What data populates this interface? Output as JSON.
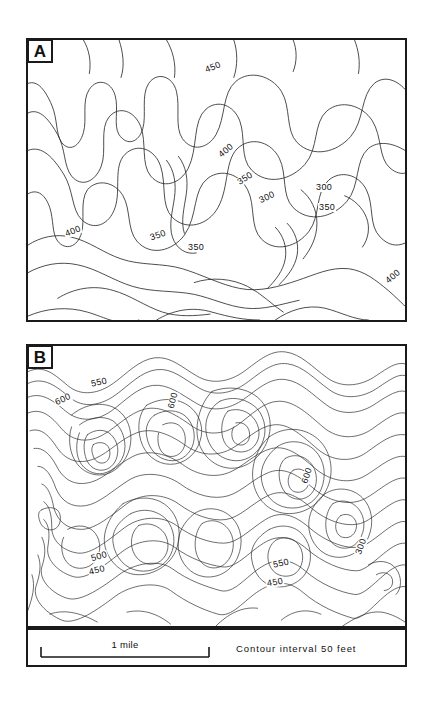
{
  "figure": {
    "background_color": "#ffffff",
    "line_color": "#2b2b2b",
    "border_color": "#1a1a1a"
  },
  "panels": [
    {
      "tag": "A",
      "description": "Topographic contour map with widely spaced, gently curving contours",
      "contour_interval": 50,
      "labels": [
        {
          "text": "450",
          "x": 204,
          "y": 63,
          "rotation": -22
        },
        {
          "text": "400",
          "x": 217,
          "y": 146,
          "rotation": -40
        },
        {
          "text": "350",
          "x": 236,
          "y": 174,
          "rotation": -33
        },
        {
          "text": "300",
          "x": 258,
          "y": 193,
          "rotation": -25
        },
        {
          "text": "300",
          "x": 315,
          "y": 183,
          "rotation": 0
        },
        {
          "text": "350",
          "x": 318,
          "y": 203,
          "rotation": 0
        },
        {
          "text": "400",
          "x": 64,
          "y": 227,
          "rotation": -22
        },
        {
          "text": "350",
          "x": 149,
          "y": 231,
          "rotation": -20
        },
        {
          "text": "350",
          "x": 187,
          "y": 243,
          "rotation": 0
        },
        {
          "text": "400",
          "x": 384,
          "y": 272,
          "rotation": -40
        }
      ]
    },
    {
      "tag": "B",
      "description": "Topographic contour map with densely packed, highly sinuous contours",
      "contour_interval": 50,
      "labels": [
        {
          "text": "550",
          "x": 90,
          "y": 378,
          "rotation": -12
        },
        {
          "text": "600",
          "x": 54,
          "y": 395,
          "rotation": -25
        },
        {
          "text": "600",
          "x": 164,
          "y": 396,
          "rotation": -75
        },
        {
          "text": "600",
          "x": 298,
          "y": 471,
          "rotation": -72
        },
        {
          "text": "500",
          "x": 90,
          "y": 552,
          "rotation": -16
        },
        {
          "text": "450",
          "x": 88,
          "y": 566,
          "rotation": -14
        },
        {
          "text": "550",
          "x": 272,
          "y": 559,
          "rotation": -12
        },
        {
          "text": "300",
          "x": 352,
          "y": 542,
          "rotation": -70
        },
        {
          "text": "450",
          "x": 266,
          "y": 578,
          "rotation": -10
        }
      ]
    }
  ],
  "scale": {
    "bar_label": "1 mile",
    "contour_interval_note": "Contour interval  50 feet"
  }
}
